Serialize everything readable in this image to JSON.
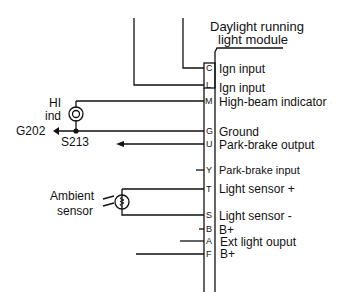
{
  "module": {
    "title_line1": "Daylight running",
    "title_line2": "light module"
  },
  "pins": [
    {
      "pin": "C",
      "function": "Ign input"
    },
    {
      "pin": "L",
      "function": "Ign input"
    },
    {
      "pin": "M",
      "function": "High-beam indicator"
    },
    {
      "pin": "G",
      "function": "Ground"
    },
    {
      "pin": "U",
      "function": "Park-brake output"
    },
    {
      "pin": "Y",
      "function": "Park-brake input"
    },
    {
      "pin": "T",
      "function": "Light sensor +"
    },
    {
      "pin": "S",
      "function": "Light sensor -"
    },
    {
      "pin": "B",
      "function": "B+"
    },
    {
      "pin": "A",
      "function": "Ext light ouput"
    },
    {
      "pin": "F",
      "function": "B+"
    }
  ],
  "components": {
    "hi_ind_line1": "HI",
    "hi_ind_line2": "ind",
    "ground": "G202",
    "splice": "S213",
    "sensor_line1": "Ambient",
    "sensor_line2": "sensor"
  },
  "icons": {
    "indicator_lamp": "lamp-circle-icon",
    "ambient_sensor": "thermistor-circle-icon",
    "ground_arrow": "arrow-left-icon",
    "splice_dot": "dot-icon"
  }
}
